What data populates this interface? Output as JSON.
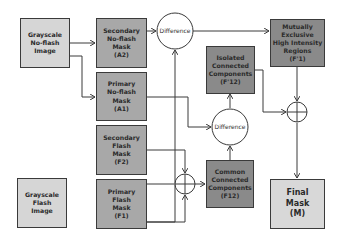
{
  "nodes": {
    "gray_noflash": {
      "label": "Grayscale\nNo-flash\nImage"
    },
    "sec_noflash": {
      "label": "Secondary\nNo-flash\nMask\n(A2)"
    },
    "pri_noflash": {
      "label": "Primary\nNo-flash\nMask\n(A1)"
    },
    "sec_flash": {
      "label": "Secondary\nFlash\nMask\n(F2)"
    },
    "gray_flash": {
      "label": "Grayscale\nFlash\nImage"
    },
    "pri_flash": {
      "label": "Primary\nFlash\nMask\n(F1)"
    },
    "isolated": {
      "label": "Isolated\nConnected\nComponents\n(F'12)"
    },
    "common": {
      "label": "Common\nConnected\nComponents\n(F12)"
    },
    "mutually": {
      "label": "Mutually\nExclusive\nHigh Intensity\nRegions\n(F'1)"
    },
    "final": {
      "label": "Final\nMask\n(M)"
    }
  },
  "operators": {
    "diff_top": {
      "label": "Difference"
    },
    "diff_mid": {
      "label": "Difference"
    }
  },
  "colors": {
    "line": "#3a3a3a",
    "light": "#d6d6d6",
    "mid": "#a8a8a8",
    "dark": "#8a8a8a"
  }
}
